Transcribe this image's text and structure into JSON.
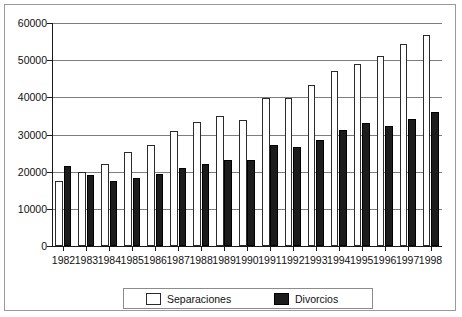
{
  "chart_data": {
    "type": "bar",
    "title": "",
    "xlabel": "",
    "ylabel": "",
    "ylim": [
      0,
      60000
    ],
    "ytick_labels": [
      "0",
      "10000",
      "20000",
      "30000",
      "40000",
      "50000",
      "60000"
    ],
    "yticks": [
      0,
      10000,
      20000,
      30000,
      40000,
      50000,
      60000
    ],
    "grid": true,
    "legend_position": "bottom",
    "categories": [
      "1982",
      "1983",
      "1984",
      "1985",
      "1986",
      "1987",
      "1988",
      "1989",
      "1990",
      "1991",
      "1992",
      "1993",
      "1994",
      "1995",
      "1996",
      "1997",
      "1998"
    ],
    "series": [
      {
        "name": "Separaciones",
        "color": "#ffffff",
        "edge_color": "#2b2b2b",
        "values": [
          17500,
          19800,
          22200,
          25200,
          27300,
          31000,
          33300,
          35000,
          34000,
          39800,
          39800,
          43400,
          47000,
          49000,
          51200,
          54400,
          56700
        ]
      },
      {
        "name": "Divorcios",
        "color": "#1c1c1c",
        "edge_color": "#000000",
        "values": [
          21500,
          19200,
          17500,
          18200,
          19500,
          21000,
          22200,
          23200,
          23100,
          27200,
          26600,
          28500,
          31200,
          33000,
          32200,
          34200,
          36000
        ]
      }
    ]
  },
  "legend": {
    "items": [
      {
        "label": "Separaciones",
        "swatch": "white-square-outline"
      },
      {
        "label": "Divorcios",
        "swatch": "black-square-filled"
      }
    ]
  },
  "colors": {
    "frame": "#9a9a9a",
    "gridline": "#7d7d7d",
    "axis": "#1a1a1a",
    "text": "#111111",
    "background": "#ffffff"
  }
}
